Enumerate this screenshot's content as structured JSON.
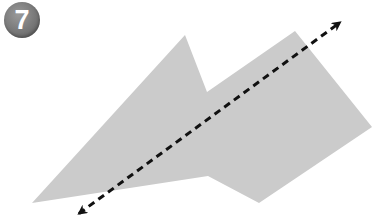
{
  "badge": {
    "number": "7",
    "color": "#7a7a7a"
  },
  "figure": {
    "shape_fill": "#cbcbcb",
    "line_color": "#111111",
    "polygon_points": "32,203 185,35 207,92 295,31 372,127 259,203 208,176",
    "line": {
      "x1": 77,
      "y1": 215,
      "x2": 342,
      "y2": 21,
      "style": "dashed",
      "arrowheads": "both"
    }
  }
}
